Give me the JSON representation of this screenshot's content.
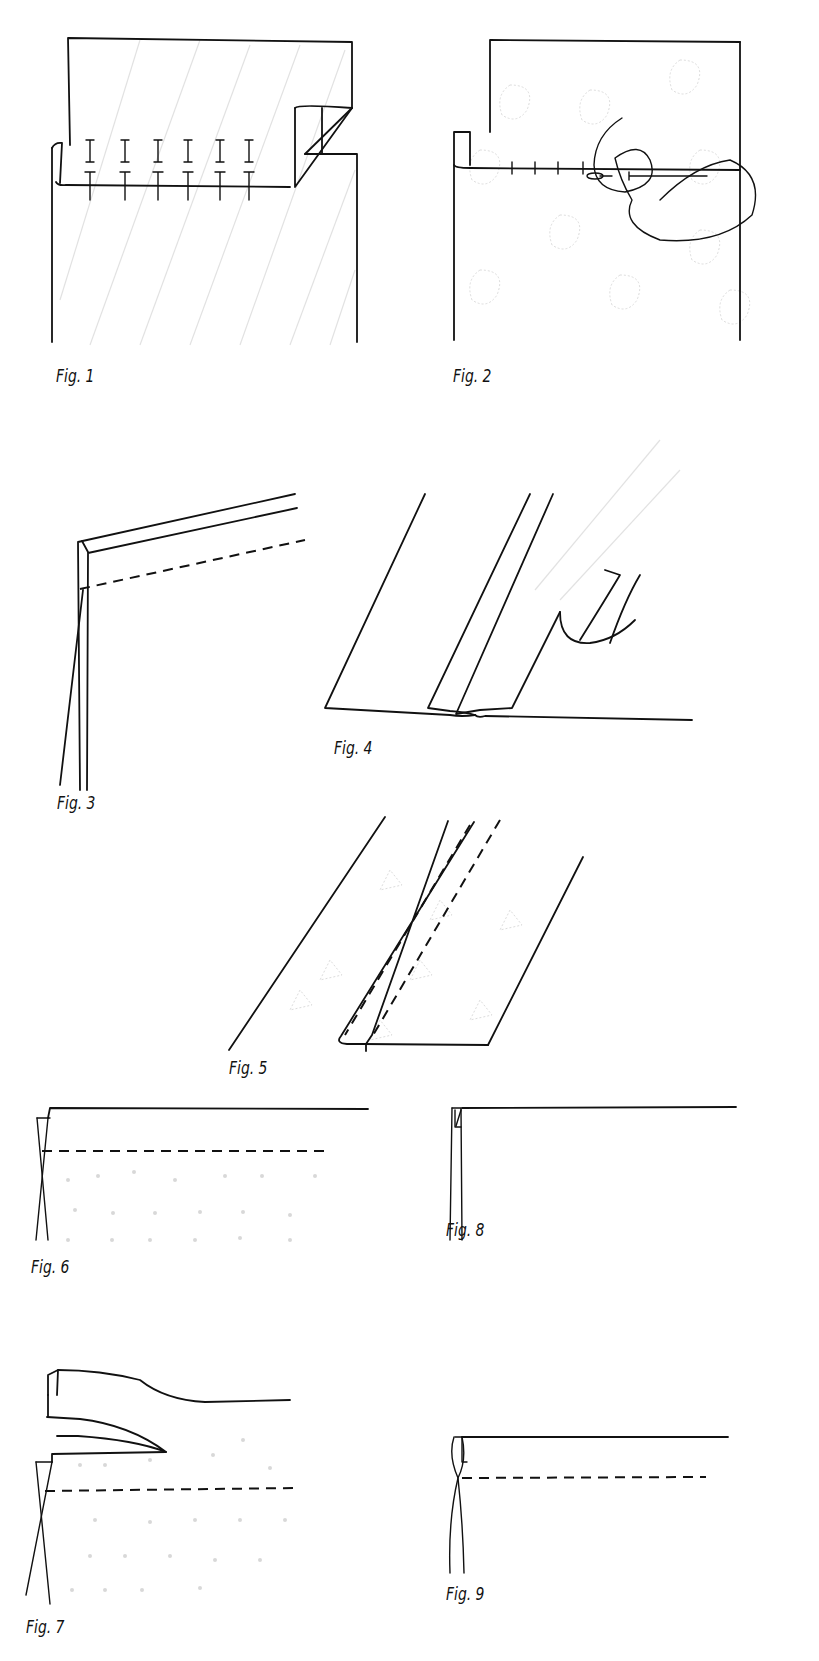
{
  "page": {
    "background": "#ffffff",
    "ink_color": "#111111"
  },
  "figures": [
    {
      "id": 1,
      "label": "Fig. 1",
      "description": "Two striped fabric layers pinned along the folded edge; the top layer's corner is rolled back"
    },
    {
      "id": 2,
      "label": "Fig. 2",
      "description": "Printed fabric layers being slip-stitched along the fold with a loose needle and thread"
    },
    {
      "id": 3,
      "label": "Fig. 3",
      "description": "Angled double edge with a dashed stitching line"
    },
    {
      "id": 4,
      "label": "Fig. 4",
      "description": "Two slanted panels joined at the bottom with a curled seam allowance"
    },
    {
      "id": 5,
      "label": "Fig. 5",
      "description": "Slanted panel with a folded-over seam and two parallel dashed stitch lines"
    },
    {
      "id": 6,
      "label": "Fig. 6",
      "description": "Horizontal edge crossing at left with a dashed stitch line across the fabric"
    },
    {
      "id": 7,
      "label": "Fig. 7",
      "description": "Top edge peeled back in layers above a dashed stitch line"
    },
    {
      "id": 8,
      "label": "Fig. 8",
      "description": "Narrow double fold at the corner of a horizontal edge"
    },
    {
      "id": 9,
      "label": "Fig. 9",
      "description": "Narrow fold at the corner with a dashed stitch line below the top edge"
    }
  ]
}
